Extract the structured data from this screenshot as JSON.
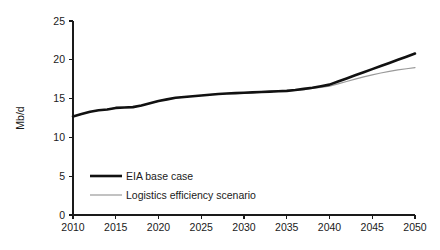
{
  "chart_data": {
    "type": "line",
    "title": "",
    "subtitle": "",
    "xlabel": "",
    "ylabel": "Mb/d",
    "xlim": [
      2010,
      2050
    ],
    "ylim": [
      0,
      25
    ],
    "grid": false,
    "legend_position": "inside-lower-left",
    "x_ticks": [
      "2010",
      "2015",
      "2020",
      "2025",
      "2030",
      "2035",
      "2040",
      "2045",
      "2050"
    ],
    "y_ticks": [
      "0",
      "5",
      "10",
      "15",
      "20",
      "25"
    ],
    "x": [
      2010,
      2011,
      2012,
      2013,
      2014,
      2015,
      2016,
      2017,
      2018,
      2019,
      2020,
      2021,
      2022,
      2023,
      2024,
      2025,
      2026,
      2027,
      2028,
      2029,
      2030,
      2031,
      2032,
      2033,
      2034,
      2035,
      2036,
      2037,
      2038,
      2039,
      2040,
      2041,
      2042,
      2043,
      2044,
      2045,
      2046,
      2047,
      2048,
      2049,
      2050
    ],
    "series": [
      {
        "name": "EIA base case",
        "color": "#111111",
        "width": 2.6,
        "values": [
          12.7,
          13.0,
          13.3,
          13.5,
          13.6,
          13.8,
          13.85,
          13.9,
          14.1,
          14.4,
          14.7,
          14.9,
          15.1,
          15.2,
          15.3,
          15.4,
          15.5,
          15.6,
          15.65,
          15.7,
          15.75,
          15.8,
          15.85,
          15.9,
          15.95,
          16.0,
          16.1,
          16.25,
          16.4,
          16.6,
          16.8,
          17.2,
          17.6,
          18.0,
          18.4,
          18.8,
          19.2,
          19.6,
          20.0,
          20.4,
          20.8
        ]
      },
      {
        "name": "Logistics efficiency scenario",
        "color": "#9a9a9a",
        "width": 1.2,
        "values": [
          12.7,
          13.0,
          13.3,
          13.5,
          13.6,
          13.8,
          13.85,
          13.9,
          14.1,
          14.4,
          14.7,
          14.9,
          15.1,
          15.2,
          15.3,
          15.4,
          15.5,
          15.6,
          15.65,
          15.7,
          15.75,
          15.8,
          15.85,
          15.9,
          15.95,
          16.0,
          16.05,
          16.15,
          16.3,
          16.45,
          16.6,
          16.9,
          17.2,
          17.5,
          17.8,
          18.05,
          18.3,
          18.5,
          18.7,
          18.85,
          19.0
        ]
      }
    ],
    "legend": [
      {
        "label": "EIA base case",
        "color": "#111111",
        "width": 2.6
      },
      {
        "label": "Logistics efficiency scenario",
        "color": "#9a9a9a",
        "width": 1.2
      }
    ]
  }
}
